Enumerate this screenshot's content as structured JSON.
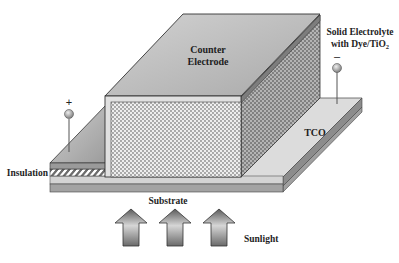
{
  "diagram": {
    "type": "solid-state dye-sensitized solar cell cross-section",
    "labels": {
      "counter_electrode_line1": "Counter",
      "counter_electrode_line2": "Electrode",
      "electrolyte_line1": "Solid Electrolyte",
      "electrolyte_line2_prefix": "with Dye/TiO",
      "electrolyte_line2_sub": "2",
      "tco": "TCO",
      "insulation": "Insulation",
      "substrate": "Substrate",
      "sunlight": "Sunlight"
    },
    "terminals": {
      "positive": "+",
      "negative": "–"
    },
    "arrows": {
      "count": 3,
      "direction": "up",
      "meaning": "sunlight incident from below"
    },
    "colors": {
      "top_face": "#b9b9b9",
      "front_face_dots": "#8a8a8a",
      "side_face": "#8f8f8f",
      "tco": "#dcdcdc",
      "substrate": "#a8a8a8",
      "outline": "#333333"
    }
  }
}
